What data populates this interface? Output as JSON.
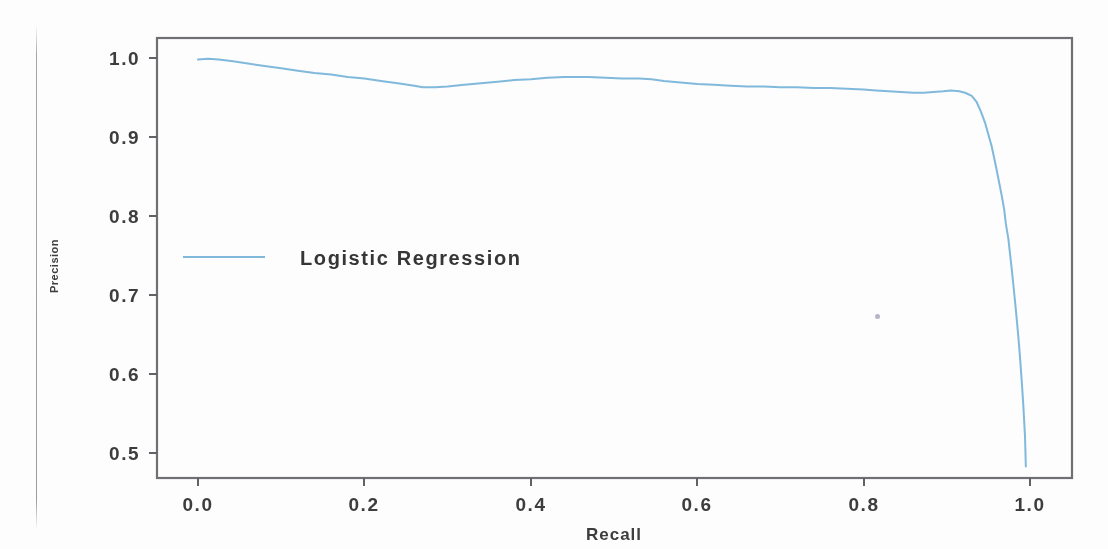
{
  "figure": {
    "kind": "precision-recall-curve",
    "render_quality": "scanned-photocopy",
    "background_color": "#fefefe"
  },
  "chart_data": {
    "type": "line",
    "title": "",
    "xlabel": "Recall",
    "ylabel": "Precision",
    "xlim": [
      -0.05,
      1.05
    ],
    "ylim": [
      0.46,
      1.02
    ],
    "grid": false,
    "legend_position": "upper-left-inside",
    "xticks": [
      0.0,
      0.2,
      0.4,
      0.6,
      0.8,
      1.0
    ],
    "xtick_labels": [
      "0.0",
      "0.2",
      "0.4",
      "0.6",
      "0.8",
      "1.0"
    ],
    "yticks": [
      0.5,
      0.6,
      0.7,
      0.8,
      0.9,
      1.0
    ],
    "ytick_labels": [
      "0.5",
      "0.6",
      "0.7",
      "0.8",
      "0.9",
      "1.0"
    ],
    "series": [
      {
        "name": "Logistic Regression",
        "color": "#7fb9dd",
        "linewidth": 2.0,
        "x": [
          0.0,
          0.012,
          0.025,
          0.042,
          0.06,
          0.08,
          0.1,
          0.12,
          0.14,
          0.16,
          0.18,
          0.2,
          0.22,
          0.24,
          0.26,
          0.27,
          0.285,
          0.3,
          0.32,
          0.34,
          0.36,
          0.38,
          0.4,
          0.42,
          0.44,
          0.455,
          0.47,
          0.49,
          0.51,
          0.53,
          0.545,
          0.56,
          0.58,
          0.6,
          0.62,
          0.64,
          0.66,
          0.68,
          0.7,
          0.72,
          0.74,
          0.76,
          0.78,
          0.8,
          0.815,
          0.83,
          0.845,
          0.86,
          0.872,
          0.884,
          0.896,
          0.905,
          0.915,
          0.922,
          0.93,
          0.936,
          0.941,
          0.946,
          0.95,
          0.954,
          0.957,
          0.96,
          0.963,
          0.966,
          0.969,
          0.971,
          0.974,
          0.976,
          0.978,
          0.98,
          0.982,
          0.984,
          0.986,
          0.988,
          0.99,
          0.992,
          0.994,
          0.995
        ],
        "y": [
          0.998,
          0.999,
          0.998,
          0.996,
          0.993,
          0.99,
          0.987,
          0.984,
          0.981,
          0.979,
          0.976,
          0.974,
          0.971,
          0.968,
          0.965,
          0.963,
          0.963,
          0.964,
          0.966,
          0.968,
          0.97,
          0.972,
          0.973,
          0.975,
          0.976,
          0.976,
          0.976,
          0.975,
          0.974,
          0.974,
          0.973,
          0.971,
          0.969,
          0.967,
          0.966,
          0.965,
          0.964,
          0.964,
          0.963,
          0.963,
          0.962,
          0.962,
          0.961,
          0.96,
          0.959,
          0.958,
          0.957,
          0.956,
          0.956,
          0.957,
          0.958,
          0.959,
          0.958,
          0.956,
          0.952,
          0.944,
          0.932,
          0.918,
          0.903,
          0.888,
          0.873,
          0.858,
          0.842,
          0.826,
          0.808,
          0.79,
          0.771,
          0.752,
          0.733,
          0.713,
          0.692,
          0.67,
          0.647,
          0.621,
          0.592,
          0.56,
          0.521,
          0.483
        ]
      }
    ]
  },
  "legend": {
    "entries": [
      {
        "label": "Logistic Regression",
        "color": "#7fb9dd"
      }
    ]
  },
  "axes": {
    "x_title": "Recall",
    "y_title": "Precision"
  }
}
